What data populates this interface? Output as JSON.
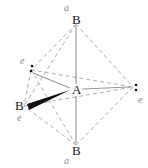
{
  "diagram": {
    "type": "trigonal bipyramidal molecular geometry (AB3E2 T-shaped)",
    "central_atom": "A",
    "atoms": {
      "top": "B",
      "bottom": "B",
      "left": "B",
      "center": "A"
    },
    "position_labels": {
      "axial_top": "a",
      "axial_bottom": "a",
      "equatorial_upper_left": "e",
      "equatorial_lower_left": "e",
      "equatorial_right": "e"
    },
    "lone_pair_symbol": ":",
    "colors": {
      "bond": "#999999",
      "wedge": "#111111",
      "dashed": "#aaaaaa",
      "label": "#222222",
      "position_label": "#888888"
    }
  }
}
